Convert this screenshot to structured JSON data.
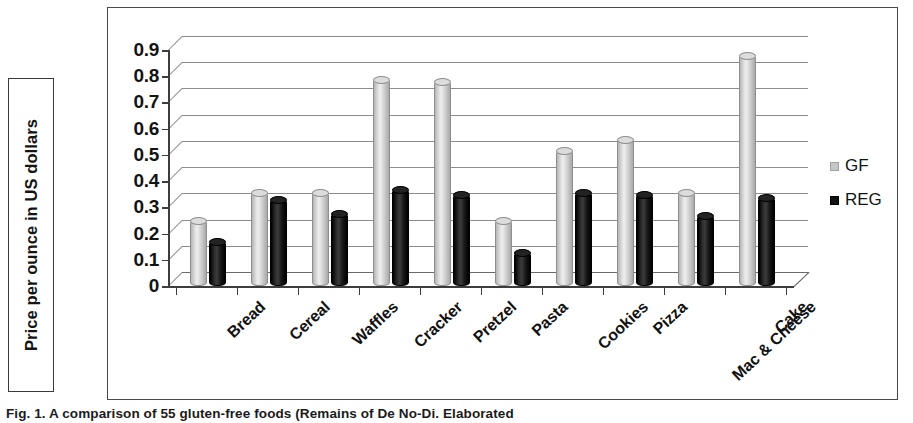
{
  "axis_title": {
    "text": "Price per ounce in US dollars"
  },
  "legend": {
    "position": "right",
    "items": [
      {
        "label": "GF",
        "color": "#c6c6c6"
      },
      {
        "label": "REG",
        "color": "#111111"
      }
    ]
  },
  "caption": {
    "text": "Fig. 1. A comparison of 55 gluten-free foods (Remains of De No-Di. Elaborated"
  },
  "chart_data": {
    "type": "bar",
    "title": "",
    "xlabel": "",
    "ylabel": "Price per ounce in US dollars",
    "ylim": [
      0,
      0.9
    ],
    "ytick_labels": [
      "0.9",
      "0.8",
      "0.7",
      "0.6",
      "0.5",
      "0.4",
      "0.3",
      "0.2",
      "0.1",
      "0"
    ],
    "ytick_values": [
      0.9,
      0.8,
      0.7,
      0.6,
      0.5,
      0.4,
      0.3,
      0.2,
      0.1,
      0
    ],
    "grid": true,
    "style": "3d-clustered-column",
    "categories": [
      "Bread",
      "Cereal",
      "Waffles",
      "Cracker",
      "Pretzel",
      "Pasta",
      "Cookies",
      "Pizza",
      "Mac & Cheese",
      "Cake"
    ],
    "series": [
      {
        "name": "GF",
        "color": "#c6c6c6",
        "values": [
          0.25,
          0.36,
          0.36,
          0.79,
          0.78,
          0.25,
          0.52,
          0.56,
          0.36,
          0.88
        ]
      },
      {
        "name": "REG",
        "color": "#111111",
        "values": [
          0.17,
          0.33,
          0.28,
          0.37,
          0.35,
          0.13,
          0.36,
          0.35,
          0.27,
          0.34
        ]
      }
    ]
  }
}
